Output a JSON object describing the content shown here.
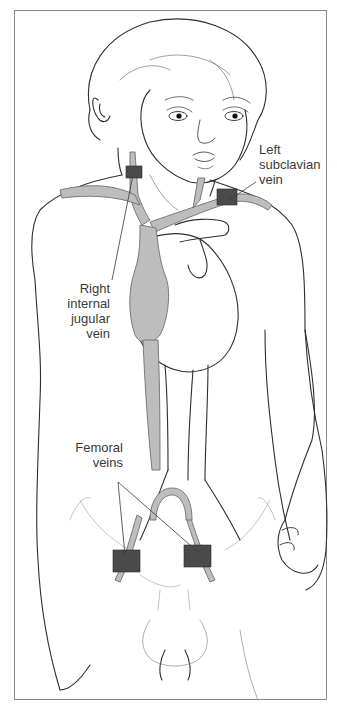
{
  "figure": {
    "colors": {
      "outline": "#2e2e2e",
      "vein_fill": "#bdbdbd",
      "vein_stroke": "#6e6e6e",
      "access_marker": "#4a4a4a",
      "label_text": "#3a3a3a",
      "frame_border": "#8a8a8a",
      "background": "#ffffff"
    },
    "labels": {
      "left_subclavian": [
        "Left",
        "subclavian",
        "vein"
      ],
      "right_internal_jugular": [
        "Right",
        "internal",
        "jugular",
        "vein"
      ],
      "femoral": [
        "Femoral",
        "veins"
      ]
    },
    "markers": [
      {
        "site": "right internal jugular vein",
        "shape": "square"
      },
      {
        "site": "left subclavian vein",
        "shape": "square"
      },
      {
        "site": "right femoral vein",
        "shape": "square"
      },
      {
        "site": "left femoral vein",
        "shape": "square"
      }
    ]
  }
}
